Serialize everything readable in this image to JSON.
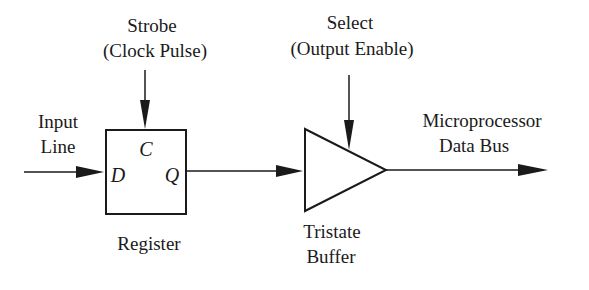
{
  "diagram": {
    "colors": {
      "stroke": "#1a1a1a",
      "background": "#ffffff"
    },
    "strobe": {
      "line1": "Strobe",
      "line2": "(Clock Pulse)"
    },
    "select": {
      "line1": "Select",
      "line2": "(Output Enable)"
    },
    "input": {
      "line1": "Input",
      "line2": "Line"
    },
    "bus": {
      "line1": "Microprocessor",
      "line2": "Data Bus"
    },
    "register": {
      "label": "Register",
      "pin_c": "C",
      "pin_d": "D",
      "pin_q": "Q"
    },
    "buffer": {
      "line1": "Tristate",
      "line2": "Buffer"
    }
  }
}
